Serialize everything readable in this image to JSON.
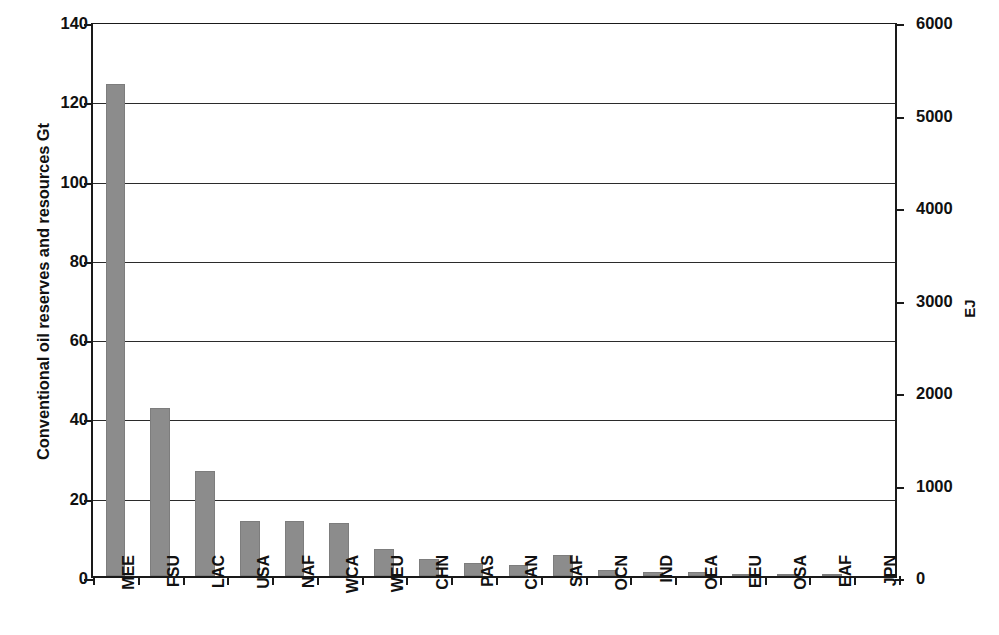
{
  "chart_data": {
    "type": "bar",
    "title": "",
    "subtitle": "",
    "categories": [
      "MEE",
      "FSU",
      "LAC",
      "USA",
      "NAF",
      "WCA",
      "WEU",
      "CHN",
      "PAS",
      "CAN",
      "SAF",
      "OCN",
      "IND",
      "OEA",
      "EEU",
      "OSA",
      "EAF",
      "JPN"
    ],
    "values": [
      124.0,
      42.3,
      26.4,
      13.9,
      13.8,
      13.4,
      6.7,
      4.3,
      3.4,
      2.9,
      5.4,
      1.5,
      1.0,
      1.1,
      0.3,
      0.3,
      0.4,
      0.0
    ],
    "xlabel": "",
    "ylabel": "Conventional oil reserves and resources Gt",
    "ylabel_secondary": "EJ",
    "ylim": [
      0,
      140
    ],
    "ylim_secondary": [
      0,
      6000
    ],
    "yticks": [
      0,
      20,
      40,
      60,
      80,
      100,
      120,
      140
    ],
    "ytick_labels": [
      "0",
      "20",
      "40",
      "60",
      "80",
      "100",
      "120",
      "140"
    ],
    "yticks_secondary": [
      0,
      1000,
      2000,
      3000,
      4000,
      5000,
      6000
    ],
    "ytick_labels_secondary": [
      "0",
      "1000",
      "2000",
      "3000",
      "4000",
      "5000",
      "6000"
    ],
    "grid": true,
    "legend": false,
    "bar_color": "#8c8c8c",
    "axis_color": "#1a1a1a",
    "gridline_color": "#2b2b2b"
  }
}
